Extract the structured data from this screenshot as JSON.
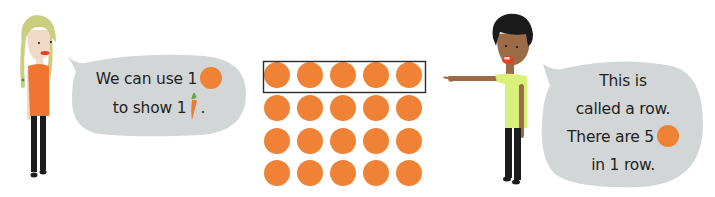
{
  "scene": {
    "colors": {
      "background": "#ffffff",
      "bubble": "#d3d6d7",
      "counter": "#ef8235",
      "row_box": "#2b2b2b",
      "text": "#1e1e1e",
      "girl_hair": "#c9cf7e",
      "girl_shirt": "#ef7531",
      "girl_skin": "#f1d9c7",
      "boy_hair": "#1a1a1a",
      "boy_skin": "#9b6a47",
      "boy_shirt": "#d9f07a",
      "trousers": "#1c1c1c",
      "carrot": "#ee7a2e",
      "carrot_leaves": "#6aa043"
    }
  },
  "left_character": {
    "name": "girl",
    "bubble": {
      "line1": "We can use 1",
      "line1_icon": "orange-counter",
      "line2": "to show 1",
      "line2_icon": "carrot",
      "line2_end": "."
    }
  },
  "right_character": {
    "name": "boy",
    "pointing_at": "top row",
    "bubble": {
      "line1": "This is",
      "line2": "called a row.",
      "line3": "There are 5",
      "line3_icon": "orange-counter",
      "line4": "in 1 row."
    }
  },
  "array": {
    "rows": 4,
    "columns": 5,
    "total_counters": 20,
    "highlighted_row": 1,
    "counter_icon": "orange-counter"
  }
}
